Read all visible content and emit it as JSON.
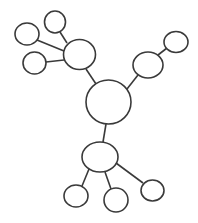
{
  "diagram": {
    "type": "network-tree",
    "background": "#ffffff",
    "stroke_color": "#3a3a3a",
    "nodes": [
      {
        "id": "center",
        "role": "root",
        "cx": 108.5,
        "cy": 102,
        "rx": 22.5,
        "ry": 22
      },
      {
        "id": "hub-upper-left",
        "role": "hub",
        "cx": 79.5,
        "cy": 54.5,
        "rx": 16,
        "ry": 15
      },
      {
        "id": "leaf-ul-top",
        "role": "leaf",
        "cx": 55,
        "cy": 22,
        "rx": 10.5,
        "ry": 11
      },
      {
        "id": "leaf-ul-left",
        "role": "leaf",
        "cx": 27,
        "cy": 34,
        "rx": 12,
        "ry": 11
      },
      {
        "id": "leaf-ul-bottom",
        "role": "leaf",
        "cx": 34.5,
        "cy": 63,
        "rx": 11.5,
        "ry": 11
      },
      {
        "id": "hub-right",
        "role": "hub",
        "cx": 148,
        "cy": 65,
        "rx": 15,
        "ry": 13
      },
      {
        "id": "leaf-r-top",
        "role": "leaf",
        "cx": 176,
        "cy": 42,
        "rx": 12,
        "ry": 10.5
      },
      {
        "id": "hub-bottom",
        "role": "hub",
        "cx": 100,
        "cy": 157,
        "rx": 18,
        "ry": 15
      },
      {
        "id": "leaf-b-left",
        "role": "leaf",
        "cx": 76,
        "cy": 196,
        "rx": 12,
        "ry": 11
      },
      {
        "id": "leaf-b-middle",
        "role": "leaf",
        "cx": 116,
        "cy": 200,
        "rx": 12,
        "ry": 12
      },
      {
        "id": "leaf-b-right",
        "role": "leaf",
        "cx": 152.5,
        "cy": 190.5,
        "rx": 11.5,
        "ry": 10.5
      }
    ],
    "edges": [
      {
        "from": "center",
        "to": "hub-upper-left",
        "x1": 96,
        "y1": 84,
        "x2": 86,
        "y2": 69
      },
      {
        "from": "hub-upper-left",
        "to": "leaf-ul-top",
        "x1": 67,
        "y1": 43,
        "x2": 60,
        "y2": 32
      },
      {
        "from": "hub-upper-left",
        "to": "leaf-ul-left",
        "x1": 64,
        "y1": 51,
        "x2": 37,
        "y2": 40
      },
      {
        "from": "hub-upper-left",
        "to": "leaf-ul-bottom",
        "x1": 64,
        "y1": 60,
        "x2": 46,
        "y2": 62
      },
      {
        "from": "center",
        "to": "hub-right",
        "x1": 127,
        "y1": 89,
        "x2": 138,
        "y2": 75
      },
      {
        "from": "hub-right",
        "to": "leaf-r-top",
        "x1": 158,
        "y1": 55,
        "x2": 167,
        "y2": 48
      },
      {
        "from": "center",
        "to": "hub-bottom",
        "x1": 106,
        "y1": 124,
        "x2": 103,
        "y2": 142
      },
      {
        "from": "hub-bottom",
        "to": "leaf-b-left",
        "x1": 89,
        "y1": 169,
        "x2": 82,
        "y2": 186
      },
      {
        "from": "hub-bottom",
        "to": "leaf-b-middle",
        "x1": 105,
        "y1": 172,
        "x2": 111,
        "y2": 189
      },
      {
        "from": "hub-bottom",
        "to": "leaf-b-right",
        "x1": 116,
        "y1": 163,
        "x2": 143,
        "y2": 183
      }
    ]
  }
}
